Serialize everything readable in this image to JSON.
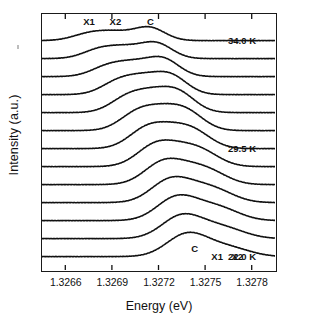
{
  "figure": {
    "axis_title_y": "Intensity (a.u.)",
    "axis_title_x": "Energy (eV)"
  },
  "annotations": {
    "top_x1": "X1",
    "top_x2": "X2",
    "top_c": "C",
    "bottom_c": "C",
    "bottom_x1": "X1",
    "bottom_x2": "X2",
    "temp_top": "34.0 K",
    "temp_mid": "29.5 K",
    "temp_bottom": "22.0 K"
  },
  "chart_data": {
    "type": "line",
    "title": "",
    "xlabel": "Energy (eV)",
    "ylabel": "Intensity (a.u.)",
    "xlim": [
      1.32645,
      1.32795
    ],
    "xticks": [
      1.3266,
      1.3269,
      1.3272,
      1.3275,
      1.3278
    ],
    "xtick_labels": [
      "1.3266",
      "1.3269",
      "1.3272",
      "1.3275",
      "1.3278"
    ],
    "grid": false,
    "legend": "none",
    "waterfall": true,
    "stacked_offset_note": "Traces are vertically offset; top trace = 34.0 K, bottom trace = 22.0 K",
    "peak_labels": [
      "C",
      "X1",
      "X2"
    ],
    "peak_label_note": "C is the main (central/strongest) line; X1 and X2 are the two satellite lines. At 22.0 K C lies low in energy with X1,X2 above it; at 34.0 K the ordering in the panel is reversed (X1,X2 at low energy, C higher).",
    "series": [
      {
        "name": "34.0 K",
        "temperature_K": 34.0,
        "baseline_y": 41,
        "peaks": [
          {
            "label": "X1",
            "center_eV": 1.32675,
            "height": 6.5,
            "width_eV": 0.000105
          },
          {
            "label": "X2",
            "center_eV": 1.32692,
            "height": 7.5,
            "width_eV": 0.000105
          },
          {
            "label": "C",
            "center_eV": 1.32714,
            "height": 13.0,
            "width_eV": 0.0001
          }
        ]
      },
      {
        "name": "33.25 K",
        "temperature_K": 33.25,
        "baseline_y": 59,
        "peaks": [
          {
            "label": "X1",
            "center_eV": 1.326815,
            "height": 8.5,
            "width_eV": 0.000105
          },
          {
            "label": "X2",
            "center_eV": 1.326985,
            "height": 9.5,
            "width_eV": 0.000105
          },
          {
            "label": "C",
            "center_eV": 1.327185,
            "height": 15.0,
            "width_eV": 0.000102
          }
        ]
      },
      {
        "name": "32.5 K",
        "temperature_K": 32.5,
        "baseline_y": 77,
        "peaks": [
          {
            "label": "X1",
            "center_eV": 1.326875,
            "height": 10.0,
            "width_eV": 0.000108
          },
          {
            "label": "X2",
            "center_eV": 1.327045,
            "height": 11.0,
            "width_eV": 0.000105
          },
          {
            "label": "C",
            "center_eV": 1.32723,
            "height": 17.0,
            "width_eV": 0.000103
          }
        ]
      },
      {
        "name": "31.75 K",
        "temperature_K": 31.75,
        "baseline_y": 95,
        "peaks": [
          {
            "label": "X1",
            "center_eV": 1.32694,
            "height": 12.5,
            "width_eV": 0.000108
          },
          {
            "label": "X2",
            "center_eV": 1.327105,
            "height": 13.5,
            "width_eV": 0.000105
          },
          {
            "label": "C",
            "center_eV": 1.32728,
            "height": 18.0,
            "width_eV": 0.000105
          }
        ]
      },
      {
        "name": "31.0 K",
        "temperature_K": 31.0,
        "baseline_y": 113,
        "peaks": [
          {
            "label": "X1",
            "center_eV": 1.327,
            "height": 14.5,
            "width_eV": 0.00011
          },
          {
            "label": "X2",
            "center_eV": 1.327165,
            "height": 15.0,
            "width_eV": 0.000108
          },
          {
            "label": "C",
            "center_eV": 1.32733,
            "height": 18.5,
            "width_eV": 0.000108
          }
        ]
      },
      {
        "name": "30.25 K",
        "temperature_K": 30.25,
        "baseline_y": 131,
        "peaks": [
          {
            "label": "X1",
            "center_eV": 1.32706,
            "height": 16.5,
            "width_eV": 0.000112
          },
          {
            "label": "X2",
            "center_eV": 1.327225,
            "height": 15.5,
            "width_eV": 0.00011
          },
          {
            "label": "C",
            "center_eV": 1.327385,
            "height": 17.0,
            "width_eV": 0.00011
          }
        ]
      },
      {
        "name": "29.5 K",
        "temperature_K": 29.5,
        "baseline_y": 149,
        "peaks": [
          {
            "label": "X1",
            "center_eV": 1.32712,
            "height": 18.5,
            "width_eV": 0.000115
          },
          {
            "label": "X2",
            "center_eV": 1.327285,
            "height": 14.0,
            "width_eV": 0.000112
          },
          {
            "label": "C",
            "center_eV": 1.327435,
            "height": 14.5,
            "width_eV": 0.000112
          }
        ]
      },
      {
        "name": "28.75 K",
        "temperature_K": 28.75,
        "baseline_y": 167,
        "peaks": [
          {
            "label": "X1",
            "center_eV": 1.327175,
            "height": 20.0,
            "width_eV": 0.000118
          },
          {
            "label": "X2",
            "center_eV": 1.327345,
            "height": 12.5,
            "width_eV": 0.000115
          },
          {
            "label": "C",
            "center_eV": 1.32749,
            "height": 12.0,
            "width_eV": 0.000115
          }
        ]
      },
      {
        "name": "28.0 K",
        "temperature_K": 28.0,
        "baseline_y": 185,
        "peaks": [
          {
            "label": "X1",
            "center_eV": 1.327225,
            "height": 21.0,
            "width_eV": 0.00012
          },
          {
            "label": "X2",
            "center_eV": 1.3274,
            "height": 11.5,
            "width_eV": 0.000115
          },
          {
            "label": "C",
            "center_eV": 1.327545,
            "height": 10.0,
            "width_eV": 0.000115
          }
        ]
      },
      {
        "name": "27.25 K",
        "temperature_K": 27.25,
        "baseline_y": 203,
        "peaks": [
          {
            "label": "X1",
            "center_eV": 1.32727,
            "height": 21.5,
            "width_eV": 0.000122
          },
          {
            "label": "X2",
            "center_eV": 1.32745,
            "height": 10.5,
            "width_eV": 0.000118
          },
          {
            "label": "C",
            "center_eV": 1.327595,
            "height": 8.5,
            "width_eV": 0.000118
          }
        ]
      },
      {
        "name": "26.5 K",
        "temperature_K": 26.5,
        "baseline_y": 221,
        "peaks": [
          {
            "label": "X1",
            "center_eV": 1.32731,
            "height": 22.0,
            "width_eV": 0.000124
          },
          {
            "label": "X2",
            "center_eV": 1.327495,
            "height": 9.5,
            "width_eV": 0.00012
          },
          {
            "label": "C",
            "center_eV": 1.32764,
            "height": 7.5,
            "width_eV": 0.000118
          }
        ]
      },
      {
        "name": "24.25 K",
        "temperature_K": 24.25,
        "baseline_y": 239,
        "peaks": [
          {
            "label": "X1",
            "center_eV": 1.327345,
            "height": 22.0,
            "width_eV": 0.000126
          },
          {
            "label": "X2",
            "center_eV": 1.327535,
            "height": 8.0,
            "width_eV": 0.00012
          },
          {
            "label": "C",
            "center_eV": 1.32768,
            "height": 6.0,
            "width_eV": 0.00012
          }
        ]
      },
      {
        "name": "22.0 K",
        "temperature_K": 22.0,
        "baseline_y": 257,
        "peaks": [
          {
            "label": "C",
            "center_eV": 1.32738,
            "height": 22.0,
            "width_eV": 0.000128
          },
          {
            "label": "X1",
            "center_eV": 1.32757,
            "height": 6.5,
            "width_eV": 0.00012
          },
          {
            "label": "X2",
            "center_eV": 1.327715,
            "height": 5.0,
            "width_eV": 0.000118
          }
        ]
      }
    ]
  },
  "annotation_positions": {
    "top_x1_x_eV": 1.32675,
    "top_x2_x_eV": 1.32692,
    "top_c_x_eV": 1.327145,
    "bottom_c_x_eV": 1.32743,
    "bottom_x1_x_eV": 1.327575,
    "bottom_x2_x_eV": 1.327705
  }
}
